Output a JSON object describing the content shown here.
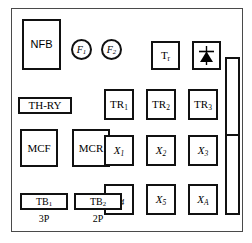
{
  "diagram": {
    "type": "electrical-panel-layout",
    "enclosure_label": "",
    "colors": {
      "background": "#ffffff",
      "component_outline": "#111111",
      "enclosure_outline": "#4a4a4a",
      "text": "#000000",
      "symbol_fill": "#000000"
    }
  },
  "components": {
    "nfb": {
      "label": "NFB",
      "shape": "rectangle"
    },
    "fuse1": {
      "label": "F",
      "sub": "1",
      "shape": "circle"
    },
    "fuse2": {
      "label": "F",
      "sub": "2",
      "shape": "circle"
    },
    "thry": {
      "label": "TH-RY",
      "shape": "rectangle"
    },
    "mcf": {
      "label": "MCF",
      "shape": "square"
    },
    "mcr": {
      "label": "MCR",
      "shape": "square"
    },
    "tb1": {
      "label": "TB",
      "sub": "1",
      "shape": "rectangle"
    },
    "tb2": {
      "label": "TB",
      "sub": "2",
      "shape": "rectangle"
    },
    "tb1_caption": "3P",
    "tb2_caption": "2P",
    "transformer": {
      "label": "T",
      "sub": "r",
      "shape": "square"
    },
    "rectifier": {
      "label": "",
      "shape": "square",
      "symbol": "diode-symbol"
    },
    "relays": [
      {
        "label": "TR",
        "sub": "1"
      },
      {
        "label": "TR",
        "sub": "2"
      },
      {
        "label": "TR",
        "sub": "3"
      }
    ],
    "aux_relays_row1": [
      {
        "label": "X",
        "sub": "1"
      },
      {
        "label": "X",
        "sub": "2"
      },
      {
        "label": "X",
        "sub": "3"
      }
    ],
    "aux_relays_row2": [
      {
        "label": "X",
        "sub": "4"
      },
      {
        "label": "X",
        "sub": "5"
      },
      {
        "label": "X",
        "sub": "A"
      }
    ],
    "terminal_rail": {
      "label": "",
      "segments": 2
    }
  }
}
